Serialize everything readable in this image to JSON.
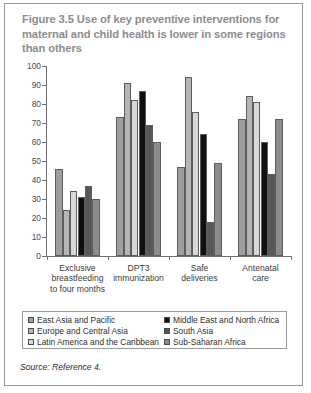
{
  "figure": {
    "title": "Figure 3.5  Use of key preventive interventions for maternal and child health is lower in some regions than others",
    "source": "Source: Reference 4."
  },
  "chart_data": {
    "type": "bar",
    "title": "Figure 3.5  Use of key preventive interventions for maternal and child health is lower in some regions than others",
    "xlabel": "",
    "ylabel": "",
    "ylim": [
      0,
      100
    ],
    "yticks": [
      0,
      10,
      20,
      30,
      40,
      50,
      60,
      70,
      80,
      90,
      100
    ],
    "grid": false,
    "legend_position": "bottom",
    "categories": [
      "Exclusive breastfeeding to four months",
      "DPT3 immunization",
      "Safe deliveries",
      "Antenatal care"
    ],
    "series": [
      {
        "name": "East Asia and Pacific",
        "color": "#9e9e9e",
        "values": [
          46,
          73,
          47,
          72
        ]
      },
      {
        "name": "Europe and Central Asia",
        "color": "#b5b5b5",
        "values": [
          24,
          91,
          94,
          84
        ]
      },
      {
        "name": "Latin America and the Caribbean",
        "color": "#d8d8d8",
        "values": [
          34,
          82,
          76,
          81
        ]
      },
      {
        "name": "Middle East and North Africa",
        "color": "#101010",
        "values": [
          31,
          87,
          64,
          60
        ]
      },
      {
        "name": "South Asia",
        "color": "#575757",
        "values": [
          37,
          69,
          18,
          43
        ]
      },
      {
        "name": "Sub-Saharan Africa",
        "color": "#8c8c8c",
        "values": [
          30,
          60,
          49,
          72
        ]
      }
    ]
  },
  "yticklabels": [
    "100",
    "90",
    "80",
    "70",
    "60",
    "50",
    "40",
    "30",
    "20",
    "10",
    "0"
  ],
  "xticklabels": [
    [
      "Exclusive",
      "breastfeeding",
      "to four months"
    ],
    [
      "DPT3",
      "immunization"
    ],
    [
      "Safe",
      "deliveries"
    ],
    [
      "Antenatal",
      "care"
    ]
  ],
  "legend": {
    "left_column": [
      "East Asia and Pacific",
      "Europe and Central Asia",
      "Latin America and the Caribbean"
    ],
    "right_column": [
      "Middle East and North Africa",
      "South Asia",
      "Sub-Saharan Africa"
    ]
  }
}
